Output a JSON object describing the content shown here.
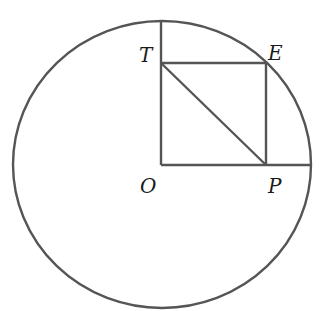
{
  "diagram": {
    "type": "geometry",
    "stroke_color": "#555555",
    "label_color": "#1a1a1a",
    "points": {
      "O": {
        "label": "O",
        "x": 161,
        "y": 165
      },
      "P": {
        "label": "P",
        "x": 266,
        "y": 165
      },
      "E": {
        "label": "E",
        "x": 266,
        "y": 63
      },
      "T": {
        "label": "T",
        "x": 161,
        "y": 63
      }
    },
    "circle": {
      "cx": 162,
      "cy": 164.5,
      "rx": 149,
      "ry": 143.5
    },
    "segments": [
      {
        "name": "O-top",
        "from": "O",
        "to": "circle-top"
      },
      {
        "name": "O-right",
        "from": "O",
        "to": "circle-right"
      },
      {
        "name": "T-E",
        "from": "T",
        "to": "E"
      },
      {
        "name": "E-P",
        "from": "E",
        "to": "P"
      },
      {
        "name": "T-P",
        "from": "T",
        "to": "P"
      }
    ],
    "labels": [
      "T",
      "E",
      "O",
      "P"
    ]
  }
}
